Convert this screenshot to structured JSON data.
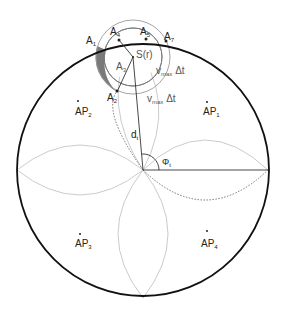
{
  "diagram": {
    "labels": {
      "A1": {
        "base": "A",
        "sub": "1"
      },
      "A2": {
        "base": "A",
        "sub": "2"
      },
      "A3": {
        "base": "A",
        "sub": "3"
      },
      "A4": {
        "base": "A",
        "sub": "4"
      },
      "A5": {
        "base": "A",
        "sub": "5"
      },
      "A7": {
        "base": "A",
        "sub": "7"
      },
      "S": {
        "text": "S(r)"
      },
      "vmax_inner": {
        "base": "v",
        "sub": "max",
        "suffix": "Δt"
      },
      "vmax_outer": {
        "base": "v",
        "sub": "max",
        "suffix": "Δt"
      },
      "dt": {
        "base": "d",
        "sub": "t"
      },
      "phi": {
        "base": "Φ",
        "sub": "t"
      },
      "AP1": {
        "base": "AP",
        "sub": "1"
      },
      "AP2": {
        "base": "AP",
        "sub": "2"
      },
      "AP3": {
        "base": "AP",
        "sub": "3"
      },
      "AP4": {
        "base": "AP",
        "sub": "4"
      }
    },
    "colors": {
      "outline": "#111111",
      "petal": "#bdbdbd",
      "shaded": "#7a7a7a",
      "circle": "#9a9a9a"
    }
  }
}
